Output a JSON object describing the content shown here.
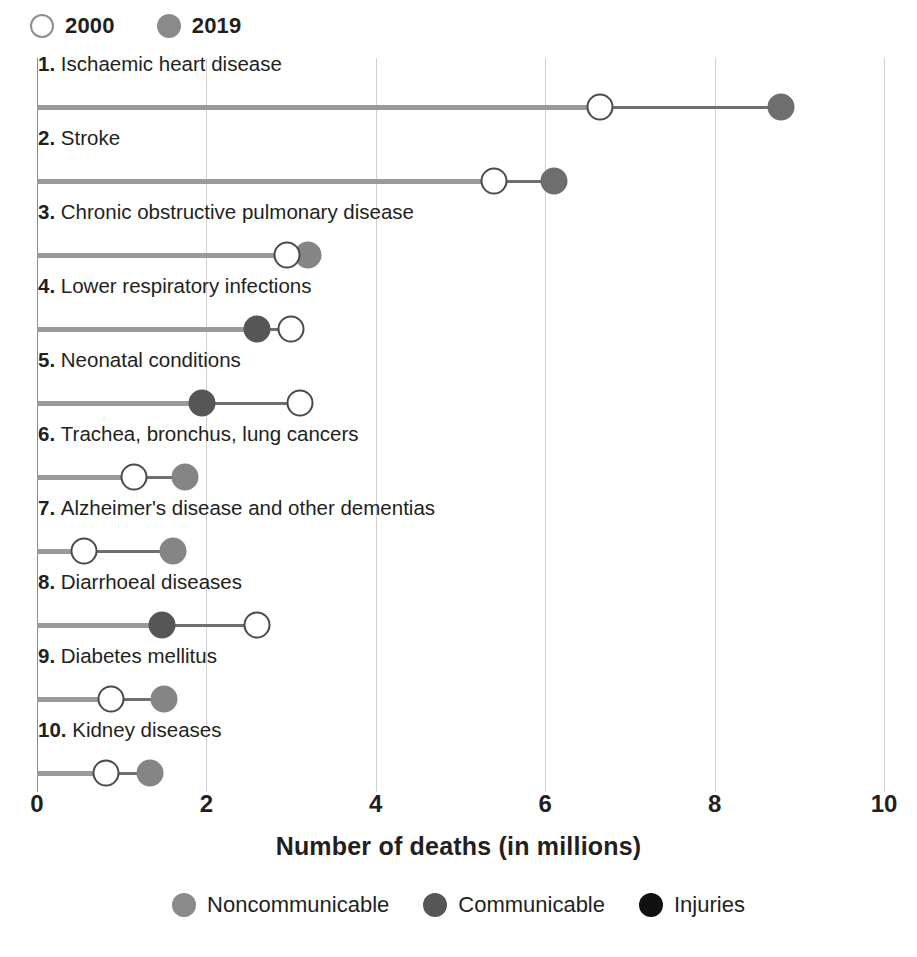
{
  "year_legend": {
    "items": [
      {
        "label": "2000",
        "style": "hollow",
        "icon": "hollow-circle-icon"
      },
      {
        "label": "2019",
        "style": "solid",
        "color": "#8a8a8a",
        "icon": "filled-circle-icon"
      }
    ]
  },
  "axis": {
    "title": "Number of deaths (in millions)",
    "ticks": [
      "0",
      "2",
      "4",
      "6",
      "8",
      "10"
    ],
    "tick_values": [
      0,
      2,
      4,
      6,
      8,
      10
    ],
    "xlim": [
      0,
      10.4
    ]
  },
  "category_legend": {
    "items": [
      {
        "label": "Noncommunicable",
        "color": "#8a8a8a"
      },
      {
        "label": "Communicable",
        "color": "#565656"
      },
      {
        "label": "Injuries",
        "color": "#111111"
      }
    ]
  },
  "chart_data": {
    "type": "scatter",
    "subtype": "dumbbell / lollipop connected-dot chart",
    "title": "",
    "xlabel": "Number of deaths (in millions)",
    "ylabel": "",
    "xlim": [
      0,
      10.4
    ],
    "xticks": [
      0,
      2,
      4,
      6,
      8,
      10
    ],
    "grid": "vertical gridlines at 2, 4, 6, 8, 10",
    "legend_position": "top-left (years) and bottom-center (categories)",
    "series": [
      {
        "name": "2000",
        "marker": "hollow circle"
      },
      {
        "name": "2019",
        "marker": "filled circle"
      }
    ],
    "categories": [
      "1. Ischaemic heart disease",
      "2. Stroke",
      "3. Chronic obstructive pulmonary disease",
      "4. Lower respiratory infections",
      "5. Neonatal conditions",
      "6. Trachea, bronchus, lung cancers",
      "7. Alzheimer's disease and other dementias",
      "8. Diarrhoeal diseases",
      "9. Diabetes mellitus",
      "10. Kidney diseases"
    ],
    "rows": [
      {
        "rank": "1.",
        "name": "Ischaemic heart disease",
        "group": "Noncommunicable",
        "color": "#6e6e6e",
        "v2000": 6.65,
        "v2019": 8.78
      },
      {
        "rank": "2.",
        "name": "Stroke",
        "group": "Noncommunicable",
        "color": "#6e6e6e",
        "v2000": 5.4,
        "v2019": 6.1
      },
      {
        "rank": "3.",
        "name": "Chronic obstructive pulmonary disease",
        "group": "Noncommunicable",
        "color": "#858585",
        "v2000": 2.95,
        "v2019": 3.2
      },
      {
        "rank": "4.",
        "name": "Lower respiratory infections",
        "group": "Communicable",
        "color": "#565656",
        "v2000": 3.0,
        "v2019": 2.6
      },
      {
        "rank": "5.",
        "name": "Neonatal conditions",
        "group": "Communicable",
        "color": "#565656",
        "v2000": 3.1,
        "v2019": 1.95
      },
      {
        "rank": "6.",
        "name": "Trachea, bronchus, lung cancers",
        "group": "Noncommunicable",
        "color": "#858585",
        "v2000": 1.15,
        "v2019": 1.75
      },
      {
        "rank": "7.",
        "name": "Alzheimer's disease and other dementias",
        "group": "Noncommunicable",
        "color": "#858585",
        "v2000": 0.55,
        "v2019": 1.6
      },
      {
        "rank": "8.",
        "name": "Diarrhoeal diseases",
        "group": "Communicable",
        "color": "#565656",
        "v2000": 2.6,
        "v2019": 1.47
      },
      {
        "rank": "9.",
        "name": "Diabetes mellitus",
        "group": "Noncommunicable",
        "color": "#858585",
        "v2000": 0.87,
        "v2019": 1.5
      },
      {
        "rank": "10.",
        "name": "Kidney diseases",
        "group": "Noncommunicable",
        "color": "#858585",
        "v2000": 0.82,
        "v2019": 1.33
      }
    ]
  }
}
